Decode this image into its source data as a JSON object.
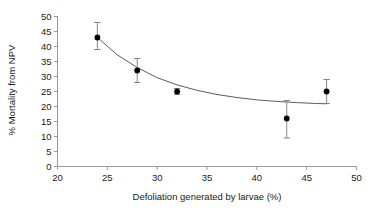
{
  "chart_data": {
    "type": "scatter",
    "title": "",
    "xlabel": "Defoliation generated by larvae (%)",
    "ylabel": "% Mortality from NPV",
    "xlim": [
      20,
      50
    ],
    "ylim": [
      0,
      50
    ],
    "xticks": [
      20,
      25,
      30,
      35,
      40,
      45,
      50
    ],
    "yticks": [
      0,
      5,
      10,
      15,
      20,
      25,
      30,
      35,
      40,
      45,
      50
    ],
    "xtick_labels": [
      "20",
      "25",
      "30",
      "35",
      "40",
      "45",
      "50"
    ],
    "ytick_labels": [
      "0",
      "5",
      "10",
      "15",
      "20",
      "25",
      "30",
      "35",
      "40",
      "45",
      "50"
    ],
    "grid": false,
    "legend": "none",
    "marker": "filled-circle",
    "error_bars": "vertical",
    "x": [
      24,
      28,
      32,
      43,
      47
    ],
    "y": [
      43,
      32,
      25,
      16,
      25
    ],
    "yerr_low": [
      39.0,
      28.0,
      24.0,
      9.5,
      21.0
    ],
    "yerr_high": [
      48.0,
      36.0,
      26.0,
      22.0,
      29.0
    ],
    "yerr": [
      4.5,
      4.0,
      1.0,
      6.5,
      4.0
    ],
    "fit_curve": {
      "label": "fitted decay curve",
      "x": [
        24,
        26,
        28,
        30,
        32,
        34,
        36,
        38,
        40,
        42,
        44,
        46,
        47
      ],
      "y": [
        43.0,
        37.2,
        33.0,
        29.6,
        27.2,
        25.4,
        24.0,
        23.0,
        22.2,
        21.7,
        21.3,
        21.0,
        20.9
      ]
    },
    "colors": {
      "marker": "#000000",
      "error_bar": "#7a7a7a",
      "curve": "#4a4a4a",
      "axis": "#9a9a9a",
      "text": "#1a1a1a",
      "background": "#ffffff"
    }
  }
}
